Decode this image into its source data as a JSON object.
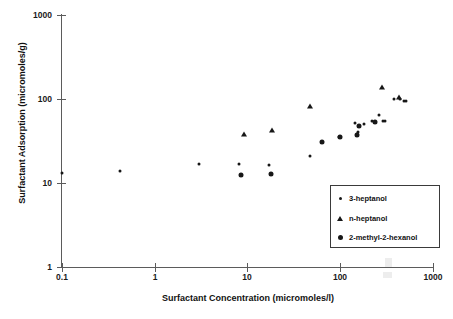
{
  "chart_data": {
    "type": "scatter",
    "title": "",
    "xlabel": "Surfactant Concentration (micromoles/l)",
    "ylabel": "Surfactant Adsorption (micromoles/g)",
    "xscale": "log",
    "yscale": "log",
    "xlim": [
      0.1,
      1000
    ],
    "ylim": [
      1,
      1000
    ],
    "xticks": [
      "0.1",
      "1",
      "10",
      "100",
      "1000"
    ],
    "yticks": [
      "1",
      "10",
      "100",
      "1000"
    ],
    "grid": false,
    "legend_position": "lower right",
    "series": [
      {
        "name": "3-heptanol",
        "marker": "small-dot",
        "points": [
          [
            0.1,
            13.0
          ],
          [
            0.42,
            14.0
          ],
          [
            3.0,
            17.0
          ],
          [
            8.0,
            17.0
          ],
          [
            17.0,
            16.5
          ],
          [
            46.0,
            21.0
          ],
          [
            95.0,
            35.0
          ],
          [
            140.0,
            52.0
          ],
          [
            150.0,
            38.0
          ],
          [
            152.0,
            41.0
          ],
          [
            175.0,
            50.0
          ],
          [
            215.0,
            55.0
          ],
          [
            255.0,
            64.0
          ],
          [
            285.0,
            54.0
          ],
          [
            300.0,
            54.0
          ],
          [
            370.0,
            99.0
          ],
          [
            430.0,
            100.0
          ],
          [
            470.0,
            95.0
          ],
          [
            500.0,
            95.0
          ]
        ]
      },
      {
        "name": "n-heptanol",
        "marker": "triangle",
        "points": [
          [
            9.0,
            38.0
          ],
          [
            18.0,
            43.0
          ],
          [
            46.0,
            82.0
          ],
          [
            275.0,
            140.0
          ],
          [
            420.0,
            106.0
          ]
        ]
      },
      {
        "name": "2-methyl-2-hexanol",
        "marker": "large-dot",
        "points": [
          [
            8.5,
            12.5
          ],
          [
            17.5,
            12.8
          ],
          [
            62.0,
            31.0
          ],
          [
            97.0,
            35.0
          ],
          [
            148.0,
            37.0
          ],
          [
            155.0,
            48.0
          ],
          [
            230.0,
            53.0
          ]
        ]
      }
    ]
  },
  "axes": {
    "x_title": "Surfactant Concentration (micromoles/l)",
    "y_title": "Surfactant Adsorption (micromoles/g)",
    "x_tick_labels": [
      "0.1",
      "1",
      "10",
      "100",
      "1000"
    ],
    "y_tick_labels": [
      "1000",
      "100",
      "10",
      "1"
    ]
  },
  "legend": {
    "entries": [
      {
        "label": "3-heptanol",
        "marker": "small-dot"
      },
      {
        "label": "n-heptanol",
        "marker": "triangle"
      },
      {
        "label": "2-methyl-2-hexanol",
        "marker": "large-dot"
      }
    ]
  },
  "colors": {
    "marker": "#171717",
    "axis": "#5b5b5b",
    "text": "#111111",
    "background": "#ffffff"
  }
}
